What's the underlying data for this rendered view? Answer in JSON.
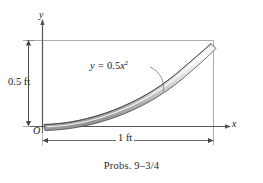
{
  "figure": {
    "caption": "Probs. 9–3/4",
    "axes": {
      "y_label": "y",
      "x_label": "x",
      "origin_label": "O"
    },
    "dimensions": {
      "vertical": {
        "label": "0.5 ft",
        "value": 0.5,
        "unit": "ft"
      },
      "horizontal": {
        "label": "1 ft",
        "value": 1,
        "unit": "ft"
      }
    },
    "curve": {
      "equation_prefix": "y = ",
      "equation_coefficient": "0.5",
      "equation_variable": "x",
      "equation_exponent": "2",
      "equation_plain": "y = 0.5x²"
    },
    "colors": {
      "line": "#555555",
      "rod_light": "#f2f2f2",
      "rod_mid": "#b8b8b8",
      "rod_dark": "#6e6e6e",
      "text": "#1a1a1a",
      "background": "#ffffff"
    }
  }
}
